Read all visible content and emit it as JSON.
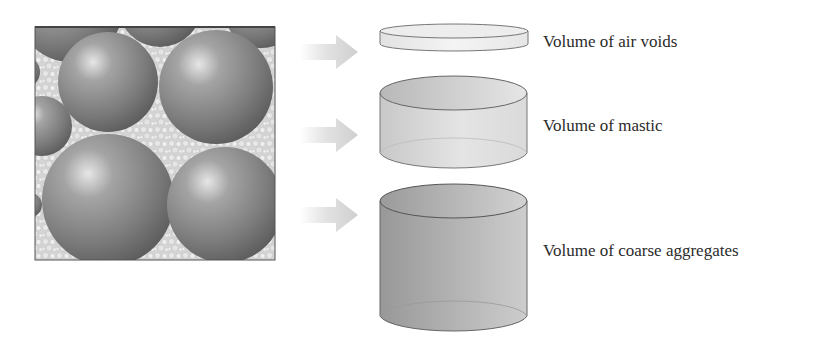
{
  "diagram": {
    "title": "",
    "mixture_panel": {
      "description": "asphalt mixture cross-section: large coarse aggregate spheres embedded in fine mastic",
      "fill_color": "#d9d9d9",
      "sphere_color": "#7a7a7a"
    },
    "arrows": [
      {
        "id": "arrow-air-voids",
        "color": "#d6d6d6"
      },
      {
        "id": "arrow-mastic",
        "color": "#d6d6d6"
      },
      {
        "id": "arrow-coarse-aggregates",
        "color": "#d6d6d6"
      }
    ],
    "components": [
      {
        "label": "Volume of air voids",
        "cylinder_fill": "#ececec"
      },
      {
        "label": "Volume of mastic",
        "cylinder_fill": "#d8d8d8"
      },
      {
        "label": "Volume of coarse aggregates",
        "cylinder_fill": "#a9a9a9"
      }
    ]
  }
}
